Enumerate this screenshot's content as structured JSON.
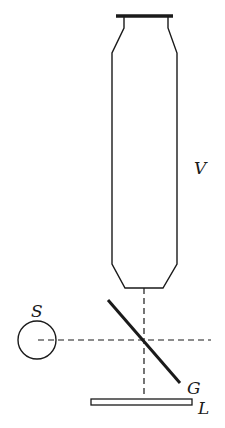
{
  "diagram": {
    "type": "optical apparatus schematic",
    "colors": {
      "background": "#ffffff",
      "stroke": "#1a1a1a"
    },
    "labels": {
      "tube": "V",
      "source": "S",
      "glass_plate": "G",
      "lens_plate": "L"
    },
    "components": [
      {
        "id": "V",
        "shape": "vertical tube with capped top and tapered bottom"
      },
      {
        "id": "S",
        "shape": "circle (light source)"
      },
      {
        "id": "G",
        "shape": "diagonal glass plate at 45 degrees"
      },
      {
        "id": "L",
        "shape": "horizontal flat plate"
      }
    ],
    "rays": [
      {
        "orientation": "vertical",
        "style": "dashed"
      },
      {
        "orientation": "horizontal",
        "style": "dashed"
      }
    ]
  }
}
